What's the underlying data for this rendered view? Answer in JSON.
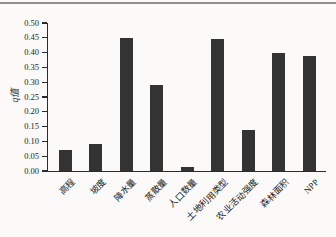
{
  "page": {
    "background": "#fbfaf8",
    "top_rule_color": "#8f8f8f"
  },
  "chart_data": {
    "type": "bar",
    "title": "",
    "xlabel": "",
    "ylabel": "q值",
    "categories": [
      "高程",
      "坡度",
      "降水量",
      "蒸散量",
      "人口数量",
      "土地利用类型",
      "农业活动强度",
      "森林面积",
      "NPP"
    ],
    "values": [
      0.07,
      0.09,
      0.45,
      0.29,
      0.012,
      0.445,
      0.14,
      0.4,
      0.39
    ],
    "ylim": [
      0.0,
      0.5
    ],
    "ytick_step": 0.05,
    "ytick_labels": [
      "0.00",
      "0.05",
      "0.10",
      "0.15",
      "0.20",
      "0.25",
      "0.30",
      "0.35",
      "0.40",
      "0.45",
      "0.50"
    ],
    "bar_color": "#333333",
    "axis_color": "#2b2b2b",
    "grid": false,
    "legend": null
  }
}
